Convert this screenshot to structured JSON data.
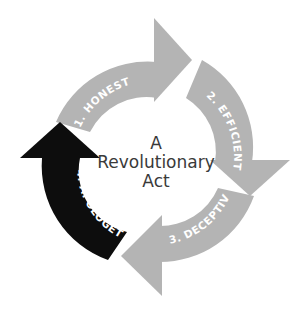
{
  "diagram": {
    "center_title_lines": [
      "A",
      "Revolutionary",
      "Act"
    ],
    "colors": {
      "inactive_arrow": "#b4b4b4",
      "active_arrow": "#0d0d0d",
      "label_text": "#ffffff",
      "center_text": "#3a3a3a",
      "background": "#ffffff"
    },
    "steps": [
      {
        "number": 1,
        "label": "1. HONEST",
        "active": false
      },
      {
        "number": 2,
        "label": "2. EFFICIENT",
        "active": false
      },
      {
        "number": 3,
        "label": "3. DECEPTIVE",
        "active": false
      },
      {
        "number": 4,
        "label": "4. APOLOGETIC",
        "active": true
      }
    ]
  }
}
